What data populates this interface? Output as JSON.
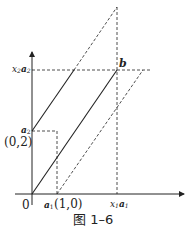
{
  "figure": {
    "caption": "图 1–6",
    "colors": {
      "stroke": "#222222",
      "background": "#ffffff"
    }
  },
  "labels": {
    "origin": "0",
    "a2_label": "a",
    "a2_sub": "2",
    "a2_coord": "(0,2)",
    "a1_label": "a",
    "a1_sub": "1",
    "a1_coord": "(1,0)",
    "x2a2_x": "x",
    "x2a2_xsub": "2",
    "x2a2_a": "a",
    "x2a2_asub": "2",
    "x1a1_x": "x",
    "x1a1_xsub": "1",
    "x1a1_a": "a",
    "x1a1_asub": "1",
    "b_label": "b"
  },
  "geometry": {
    "origin": [
      32,
      194
    ],
    "a1_point": [
      57,
      194
    ],
    "a2_point": [
      32,
      131
    ],
    "b_point": [
      117,
      70
    ],
    "apex_point": [
      117,
      7
    ],
    "x_axis_end": [
      184,
      194
    ],
    "y_axis_end": [
      32,
      52
    ]
  }
}
